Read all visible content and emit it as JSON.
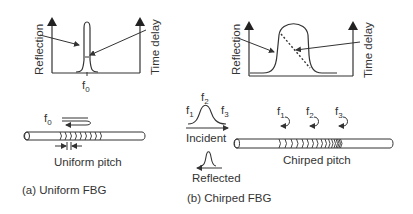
{
  "panel_a": {
    "plot": {
      "left_axis_label": "Reflection",
      "right_axis_label": "Time delay",
      "peak_label": "f",
      "peak_label_sub": "0"
    },
    "fiber": {
      "wave_label": "f",
      "wave_label_sub": "0",
      "pitch_label": "Uniform pitch"
    },
    "caption": "(a) Uniform FBG"
  },
  "panel_b": {
    "plot": {
      "left_axis_label": "Reflection",
      "right_axis_label": "Time delay"
    },
    "spectrum": {
      "f1": "f",
      "f1_sub": "1",
      "f2": "f",
      "f2_sub": "2",
      "f3": "f",
      "f3_sub": "3",
      "incident_label": "Incident",
      "reflected_label": "Reflected"
    },
    "fiber": {
      "markers": [
        {
          "label": "f",
          "sub": "1"
        },
        {
          "label": "f",
          "sub": "2"
        },
        {
          "label": "f",
          "sub": "3"
        }
      ],
      "pitch_label": "Chirped pitch"
    },
    "caption": "(b) Chirped FBG"
  },
  "colors": {
    "line": "#333333",
    "background": "#ffffff"
  }
}
